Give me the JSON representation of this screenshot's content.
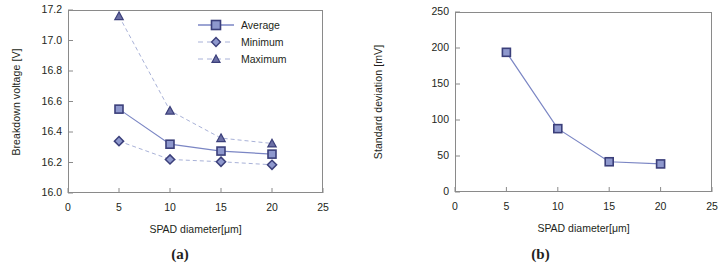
{
  "figure": {
    "panels": [
      {
        "caption": "(a)",
        "chart_data": {
          "type": "line",
          "title": "",
          "xlabel": "SPAD diameter[μm]",
          "ylabel": "Breakdown voltage  [V]",
          "x": [
            5,
            10,
            15,
            20
          ],
          "xlim": [
            0,
            25
          ],
          "ylim": [
            16.0,
            17.2
          ],
          "xticks": [
            "0",
            "5",
            "10",
            "15",
            "20",
            "25"
          ],
          "xtick_values": [
            0,
            5,
            10,
            15,
            20,
            25
          ],
          "yticks": [
            "16.0",
            "16.2",
            "16.4",
            "16.6",
            "16.8",
            "17.0",
            "17.2"
          ],
          "ytick_values": [
            16.0,
            16.2,
            16.4,
            16.6,
            16.8,
            17.0,
            17.2
          ],
          "grid": false,
          "legend_position": "upper right",
          "series": [
            {
              "name": "Average",
              "values": [
                16.55,
                16.32,
                16.275,
                16.255
              ],
              "marker": "square",
              "linestyle": "solid",
              "color": "#7b86c4",
              "fill": "#8e98cd",
              "edge": "#3b3f7a"
            },
            {
              "name": "Minimum",
              "values": [
                16.34,
                16.22,
                16.205,
                16.185
              ],
              "marker": "diamond",
              "linestyle": "dashed",
              "color": "#a9b2d8",
              "fill": "#8e98cd",
              "edge": "#3b3f7a"
            },
            {
              "name": "Maximum",
              "values": [
                17.16,
                16.54,
                16.36,
                16.325
              ],
              "marker": "triangle",
              "linestyle": "dashed",
              "color": "#a9b2d8",
              "fill": "#6b6fa5",
              "edge": "#3b3f7a"
            }
          ]
        }
      },
      {
        "caption": "(b)",
        "chart_data": {
          "type": "line",
          "title": "",
          "xlabel": "SPAD diameter[μm]",
          "ylabel": "Standard deviation [mV]",
          "x": [
            5,
            10,
            15,
            20
          ],
          "xlim": [
            0,
            25
          ],
          "ylim": [
            0,
            250
          ],
          "xticks": [
            "0",
            "5",
            "10",
            "15",
            "20",
            "25"
          ],
          "xtick_values": [
            0,
            5,
            10,
            15,
            20,
            25
          ],
          "yticks": [
            "0",
            "50",
            "100",
            "150",
            "200",
            "250"
          ],
          "ytick_values": [
            0,
            50,
            100,
            150,
            200,
            250
          ],
          "grid": false,
          "legend_position": "none",
          "series": [
            {
              "name": "Standard deviation",
              "values": [
                194,
                88,
                42,
                39
              ],
              "marker": "square",
              "linestyle": "solid",
              "color": "#7b86c4",
              "fill": "#8e98cd",
              "edge": "#3b3f7a"
            }
          ]
        }
      }
    ]
  }
}
